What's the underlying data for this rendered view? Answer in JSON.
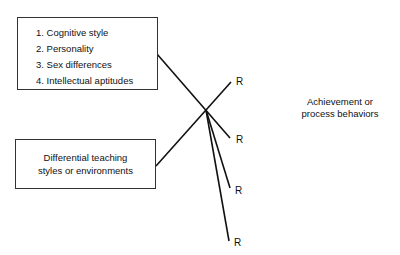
{
  "diagram": {
    "input_box": {
      "items": [
        "1. Cognitive style",
        "2. Personality",
        "3. Sex differences",
        "4. Intellectual aptitudes"
      ]
    },
    "treatment_box": {
      "lines": [
        "Differential teaching",
        "styles or environments"
      ]
    },
    "responses": [
      "R",
      "R",
      "R",
      "R"
    ],
    "outcome": {
      "lines": [
        "Achievement or",
        "process behaviors"
      ]
    },
    "line_color": "#111111"
  }
}
